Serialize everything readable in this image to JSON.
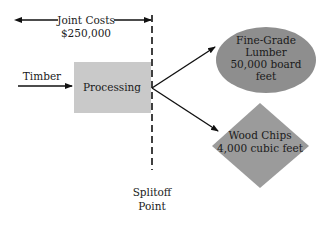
{
  "diagram": {
    "joint_costs": {
      "label": "Joint Costs",
      "amount": "$250,000"
    },
    "input": {
      "label": "Timber"
    },
    "process": {
      "label": "Processing"
    },
    "products": [
      {
        "name_line1": "Fine-Grade",
        "name_line2": "Lumber",
        "qty_line1": "50,000 board",
        "qty_line2": "feet",
        "shape": "ellipse"
      },
      {
        "name_line1": "Wood Chips",
        "qty_line1": "4,000 cubic feet",
        "shape": "diamond"
      }
    ],
    "splitoff": {
      "line1": "Splitoff",
      "line2": "Point"
    }
  },
  "colors": {
    "process_fill": "#c9c9c9",
    "ellipse_fill": "#8e8e8e",
    "diamond_fill": "#9b9b9b",
    "line": "#111111"
  }
}
